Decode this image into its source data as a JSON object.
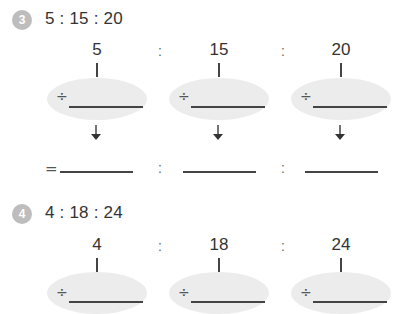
{
  "problems": [
    {
      "number": "3",
      "ratio_text": "5 : 15 : 20",
      "terms": [
        "5",
        "15",
        "20"
      ],
      "separator": ":",
      "operator": "÷",
      "result_prefix": "=",
      "has_result_row": true
    },
    {
      "number": "4",
      "ratio_text": "4 : 18 : 24",
      "terms": [
        "4",
        "18",
        "24"
      ],
      "separator": ":",
      "operator": "÷",
      "has_result_row": false
    }
  ],
  "colors": {
    "badge": "#bdbdbd",
    "ellipse": "#ececec",
    "text": "#333333",
    "line": "#444444"
  }
}
